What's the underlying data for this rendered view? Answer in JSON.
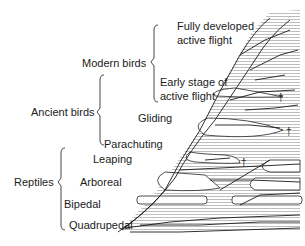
{
  "diagram": {
    "groups": [
      {
        "id": "modern-birds",
        "label": "Modern birds"
      },
      {
        "id": "ancient-birds",
        "label": "Ancient birds"
      },
      {
        "id": "reptiles",
        "label": "Reptiles"
      }
    ],
    "stages": [
      {
        "id": "fully-developed",
        "line1": "Fully developed",
        "line2": "active flight"
      },
      {
        "id": "early-stage",
        "line1": "Early stage of",
        "line2": "active flight"
      },
      {
        "id": "gliding",
        "label": "Gliding"
      },
      {
        "id": "parachuting",
        "label": "Parachuting"
      },
      {
        "id": "leaping",
        "label": "Leaping"
      },
      {
        "id": "arboreal",
        "label": "Arboreal"
      },
      {
        "id": "bipedal",
        "label": "Bipedal"
      },
      {
        "id": "quadrupedal",
        "label": "Quadrupedal"
      }
    ],
    "extinction_marker": "†"
  }
}
